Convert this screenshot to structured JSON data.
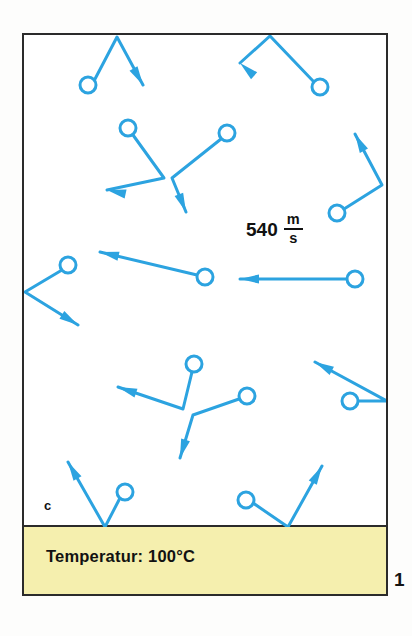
{
  "figure": {
    "number": "1",
    "panel_letter": "c",
    "background_color": "#ffffff",
    "frame_color": "#2b2b2b"
  },
  "container": {
    "name": "gas-container",
    "fill": "#ffffff"
  },
  "temperature_bar": {
    "label": "Temperatur: 100°C",
    "fill_color": "#f5efae",
    "text_color": "#121212"
  },
  "speed_annotation": {
    "value": "540",
    "unit_numerator": "m",
    "unit_denominator": "s",
    "full_text": "540 m/s"
  },
  "molecules": {
    "color": "#2ca3e0",
    "count": 13,
    "radius": 8,
    "items": [
      {
        "id": "molecule-1",
        "cx": 88,
        "cy": 85,
        "path": "M 95 79 L 117 37 L 143 85",
        "arrow_at": [
          143,
          85
        ],
        "arrow_angle": 60
      },
      {
        "id": "molecule-2",
        "cx": 320,
        "cy": 87,
        "path": "M 314 82 L 270 36 L 240 63",
        "arrow_at": [
          240,
          63
        ],
        "arrow_angle": 222
      },
      {
        "id": "molecule-3",
        "cx": 128,
        "cy": 128,
        "path": "M 133 135 L 164 178 L 107 190",
        "arrow_at": [
          107,
          190
        ],
        "arrow_angle": 192
      },
      {
        "id": "molecule-4",
        "cx": 227,
        "cy": 133,
        "path": "M 221 139 L 172 178 L 186 212",
        "arrow_at": [
          186,
          212
        ],
        "arrow_angle": 68
      },
      {
        "id": "molecule-5",
        "cx": 337,
        "cy": 213,
        "path": "M 344 209 L 382 185 L 355 134",
        "arrow_at": [
          355,
          134
        ],
        "arrow_angle": 242
      },
      {
        "id": "molecule-6",
        "cx": 68,
        "cy": 265,
        "path": "M 62 270 L 25 292 L 78 325",
        "arrow_at": [
          78,
          325
        ],
        "arrow_angle": 32
      },
      {
        "id": "molecule-7",
        "cx": 205,
        "cy": 277,
        "path": "M 197 275 L 100 252",
        "arrow_at": [
          100,
          252
        ],
        "arrow_angle": 193
      },
      {
        "id": "molecule-8",
        "cx": 355,
        "cy": 279,
        "path": "M 347 279 L 240 279",
        "arrow_at": [
          240,
          279
        ],
        "arrow_angle": 180
      },
      {
        "id": "molecule-9",
        "cx": 194,
        "cy": 364,
        "path": "M 192 372 L 183 409 L 118 387",
        "arrow_at": [
          118,
          387
        ],
        "arrow_angle": 199
      },
      {
        "id": "molecule-10",
        "cx": 247,
        "cy": 396,
        "path": "M 239 399 L 193 415 L 180 458",
        "arrow_at": [
          180,
          458
        ],
        "arrow_angle": 107
      },
      {
        "id": "molecule-11",
        "cx": 350,
        "cy": 401,
        "path": "M 358 401 L 387 401 L 315 362",
        "arrow_at": [
          315,
          362
        ],
        "arrow_angle": 208
      },
      {
        "id": "molecule-12",
        "cx": 125,
        "cy": 492,
        "path": "M 120 498 L 105 527 L 68 462",
        "arrow_at": [
          68,
          462
        ],
        "arrow_angle": 240
      },
      {
        "id": "molecule-13",
        "cx": 246,
        "cy": 500,
        "path": "M 253 503 L 288 527 L 322 466",
        "arrow_at": [
          322,
          466
        ],
        "arrow_angle": 299
      }
    ]
  }
}
